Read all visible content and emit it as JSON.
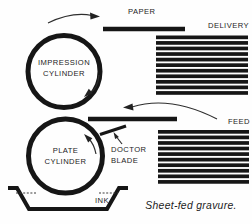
{
  "caption": "Sheet-fed gravure.",
  "colors": {
    "ink": "#161616",
    "arrow": "#2e2e2e",
    "background": "#fefefe"
  },
  "labels": {
    "paper": "PAPER",
    "delivery": "DELIVERY",
    "feed": "FEED",
    "ink": "INK",
    "impression_cylinder": {
      "line1": "IMPRESSION",
      "line2": "CYLINDER"
    },
    "plate_cylinder": {
      "line1": "PLATE",
      "line2": "CYLINDER"
    },
    "doctor_blade": {
      "line1": "DOCTOR",
      "line2": "BLADE"
    }
  },
  "piles": {
    "delivery": {
      "x": 156,
      "y": 35.5,
      "width": 92,
      "count": 11,
      "pitch": 5.56,
      "thickness": 3.7
    },
    "feed": {
      "x": 158,
      "y": 130,
      "width": 91,
      "count": 10,
      "pitch": 5.56,
      "thickness": 3.7
    }
  }
}
